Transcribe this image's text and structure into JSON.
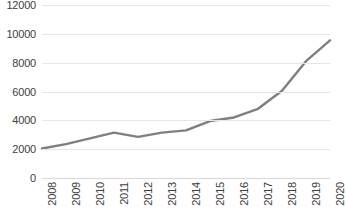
{
  "chart_data": {
    "type": "line",
    "title": "",
    "subtitle": "",
    "xlabel": "",
    "ylabel": "",
    "categories": [
      "2008",
      "2009",
      "2010",
      "2011",
      "2012",
      "2013",
      "2014",
      "2015",
      "2016",
      "2017",
      "2018",
      "2019",
      "2020"
    ],
    "values": [
      2050,
      2350,
      2750,
      3150,
      2850,
      3150,
      3300,
      3950,
      4200,
      4800,
      6050,
      8100,
      9550
    ],
    "series": [
      {
        "name": "Series 1",
        "values": [
          2050,
          2350,
          2750,
          3150,
          2850,
          3150,
          3300,
          3950,
          4200,
          4800,
          6050,
          8100,
          9550
        ]
      }
    ],
    "ylim": [
      0,
      12000
    ],
    "ytick_values": [
      0,
      2000,
      4000,
      6000,
      8000,
      10000,
      12000
    ],
    "ytick_labels": [
      "0",
      "2000",
      "4000",
      "6000",
      "8000",
      "10000",
      "12000"
    ],
    "grid": true,
    "grid_axis": "y",
    "legend": false,
    "legend_position": "none",
    "annotations": [],
    "colors": {
      "line": "#7f7f7f",
      "gridline": "#e6e6e6",
      "baseline": "#d9d9d9",
      "tick_text": "#404040",
      "background": "#ffffff"
    },
    "line_width": 2.4,
    "markers": false
  }
}
